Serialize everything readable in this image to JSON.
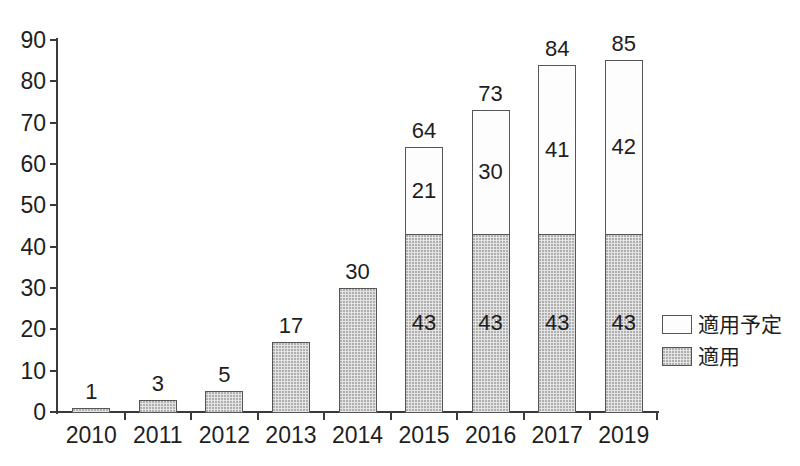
{
  "chart_data": {
    "type": "bar",
    "subtype": "stacked",
    "categories": [
      "2010",
      "2011",
      "2012",
      "2013",
      "2014",
      "2015",
      "2016",
      "2017",
      "2019"
    ],
    "series": [
      {
        "name": "適用",
        "role": "applied",
        "values": [
          1,
          3,
          5,
          17,
          30,
          43,
          43,
          43,
          43
        ]
      },
      {
        "name": "適用予定",
        "role": "planned",
        "values": [
          0,
          0,
          0,
          0,
          0,
          21,
          30,
          41,
          42
        ]
      }
    ],
    "totals": [
      1,
      3,
      5,
      17,
      30,
      64,
      73,
      84,
      85
    ],
    "title": "",
    "xlabel": "",
    "ylabel": "",
    "ylim": [
      0,
      90
    ],
    "yticks": [
      0,
      10,
      20,
      30,
      40,
      50,
      60,
      70,
      80,
      90
    ],
    "grid": "off",
    "legend_position": "right",
    "legend": [
      {
        "label": "適用予定",
        "swatch": "planned"
      },
      {
        "label": "適用",
        "swatch": "applied"
      }
    ],
    "colors": {
      "applied_fill": "#e4e4e4",
      "planned_fill": "#fdfdfd",
      "bar_border": "#565656",
      "axis": "#3a3a3a",
      "text": "#1e1e1e",
      "background": "#ffffff"
    }
  }
}
